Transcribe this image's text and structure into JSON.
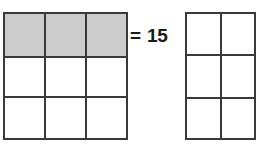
{
  "diagram": {
    "type": "fraction-area-model",
    "background_color": "#ffffff",
    "gridline_color": "#3a3a3a",
    "shaded_color": "#cccccc",
    "unshaded_color": "#ffffff"
  },
  "left_grid": {
    "name": "left-grid",
    "columns": 3,
    "rows": 3,
    "total_cells": 9,
    "shaded_cells": 3,
    "cells": [
      {
        "id": "r1c1",
        "shaded": true
      },
      {
        "id": "r1c2",
        "shaded": true
      },
      {
        "id": "r1c3",
        "shaded": true
      },
      {
        "id": "r2c1",
        "shaded": false
      },
      {
        "id": "r2c2",
        "shaded": false
      },
      {
        "id": "r2c3",
        "shaded": false
      },
      {
        "id": "r3c1",
        "shaded": false
      },
      {
        "id": "r3c2",
        "shaded": false
      },
      {
        "id": "r3c3",
        "shaded": false
      }
    ]
  },
  "right_grid": {
    "name": "right-grid",
    "columns": 2,
    "rows": 3,
    "total_cells": 6,
    "shaded_cells": 0,
    "cells": [
      {
        "id": "r1c1",
        "shaded": false
      },
      {
        "id": "r1c2",
        "shaded": false
      },
      {
        "id": "r2c1",
        "shaded": false
      },
      {
        "id": "r2c2",
        "shaded": false
      },
      {
        "id": "r3c1",
        "shaded": false
      },
      {
        "id": "r3c2",
        "shaded": false
      }
    ]
  },
  "equation": {
    "sign": "=",
    "value": "15",
    "full_text": "= 15"
  }
}
